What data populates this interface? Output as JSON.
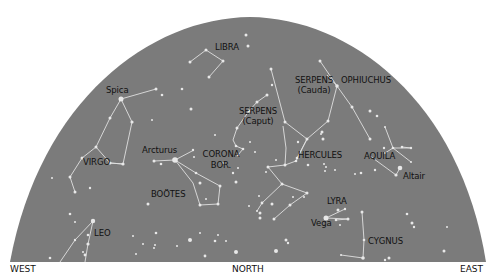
{
  "sky_colors": {
    "dome": "#7b7b7b",
    "star": "#e8e8e8",
    "line": "#e0e0e0",
    "label": "#111111"
  },
  "directions": {
    "west": "WEST",
    "north": "NORTH",
    "east": "EAST"
  },
  "labels": {
    "libra": "LIBRA",
    "spica": "Spica",
    "serpens_cauda_1": "SERPENS",
    "serpens_cauda_2": "(Cauda)",
    "ophiuchus": "OPHIUCHUS",
    "serpens_caput_1": "SERPENS",
    "serpens_caput_2": "(Caput)",
    "arcturus": "Arcturus",
    "corona_1": "CORONA",
    "corona_2": "BOR.",
    "hercules": "HERCULES",
    "aquila": "AQUILA",
    "altair": "Altair",
    "virgo": "VIRGO",
    "bootes": "BOÖTES",
    "lyra": "LYRA",
    "vega": "Vega",
    "leo": "LEO",
    "cygnus": "CYGNUS"
  },
  "stars": [
    [
      121,
      99,
      2.5
    ],
    [
      156,
      89,
      1.5
    ],
    [
      162,
      95,
      1.3
    ],
    [
      110,
      118,
      1.5
    ],
    [
      132,
      122,
      1.6
    ],
    [
      96,
      147,
      1.5
    ],
    [
      82,
      158,
      1.5
    ],
    [
      110,
      163,
      1.5
    ],
    [
      123,
      164,
      1.6
    ],
    [
      70,
      177,
      1.5
    ],
    [
      75,
      192,
      1.5
    ],
    [
      90,
      188,
      1.2
    ],
    [
      52,
      178,
      1
    ],
    [
      190,
      62,
      1.5
    ],
    [
      206,
      50,
      1.5
    ],
    [
      223,
      61,
      1.5
    ],
    [
      209,
      77,
      1.5
    ],
    [
      246,
      35,
      1.5
    ],
    [
      248,
      46,
      1.5
    ],
    [
      182,
      89,
      1.3
    ],
    [
      191,
      109,
      1.5
    ],
    [
      152,
      120,
      1
    ],
    [
      175,
      160,
      2.8
    ],
    [
      154,
      161,
      1.5
    ],
    [
      161,
      164,
      1.3
    ],
    [
      194,
      157,
      1
    ],
    [
      196,
      173,
      1.3
    ],
    [
      200,
      183,
      1.5
    ],
    [
      220,
      186,
      1.5
    ],
    [
      218,
      204,
      1.5
    ],
    [
      200,
      205,
      1.5
    ],
    [
      193,
      150,
      1.2
    ],
    [
      215,
      135,
      1
    ],
    [
      233,
      173,
      1.2
    ],
    [
      236,
      182,
      1.5
    ],
    [
      238,
      168,
      1
    ],
    [
      223,
      163,
      1
    ],
    [
      206,
      199,
      1
    ],
    [
      237,
      128,
      1.5
    ],
    [
      249,
      111,
      1.5
    ],
    [
      257,
      102,
      1.5
    ],
    [
      267,
      95,
      1.5
    ],
    [
      272,
      85,
      1.2
    ],
    [
      236,
      146,
      1.3
    ],
    [
      243,
      149,
      1.3
    ],
    [
      238,
      155,
      1.2
    ],
    [
      255,
      152,
      1
    ],
    [
      250,
      142,
      1
    ],
    [
      271,
      69,
      1.5
    ],
    [
      285,
      122,
      1.5
    ],
    [
      307,
      139,
      1.5
    ],
    [
      298,
      142,
      1.2
    ],
    [
      297,
      158,
      1.3
    ],
    [
      296,
      161,
      1.3
    ],
    [
      285,
      165,
      1.5
    ],
    [
      268,
      167,
      1.5
    ],
    [
      282,
      184,
      1.5
    ],
    [
      259,
      196,
      1
    ],
    [
      262,
      203,
      1.4
    ],
    [
      272,
      204,
      1.5
    ],
    [
      307,
      193,
      1.5
    ],
    [
      290,
      205,
      1.5
    ],
    [
      274,
      219,
      1.5
    ],
    [
      249,
      206,
      1
    ],
    [
      257,
      211,
      1
    ],
    [
      328,
      121,
      1.5
    ],
    [
      322,
      132,
      1.5
    ],
    [
      323,
      139,
      1.5
    ],
    [
      321,
      134,
      1
    ],
    [
      307,
      139,
      1
    ],
    [
      308,
      165,
      1.3
    ],
    [
      276,
      160,
      1
    ],
    [
      266,
      172,
      1
    ],
    [
      320,
      61,
      1.5
    ],
    [
      337,
      86,
      1.8
    ],
    [
      352,
      107,
      1.5
    ],
    [
      370,
      111,
      1.5
    ],
    [
      385,
      127,
      1
    ],
    [
      377,
      116,
      1.3
    ],
    [
      393,
      148,
      1.3
    ],
    [
      385,
      153,
      1
    ],
    [
      402,
      147,
      1.3
    ],
    [
      411,
      148,
      1.2
    ],
    [
      411,
      162,
      1
    ],
    [
      370,
      139,
      1.5
    ],
    [
      384,
      148,
      1.2
    ],
    [
      375,
      170,
      1.2
    ],
    [
      396,
      175,
      1.6
    ],
    [
      400,
      168,
      2.3
    ],
    [
      324,
      164,
      1
    ],
    [
      326,
      167,
      1
    ],
    [
      335,
      170,
      1
    ],
    [
      325,
      171,
      1
    ],
    [
      355,
      174,
      1
    ],
    [
      361,
      173,
      1.3
    ],
    [
      326,
      218,
      2.5
    ],
    [
      338,
      210,
      1.5
    ],
    [
      345,
      209,
      1.2
    ],
    [
      336,
      220,
      1.3
    ],
    [
      348,
      219,
      1.5
    ],
    [
      340,
      225,
      1
    ],
    [
      362,
      212,
      1.5
    ],
    [
      364,
      240,
      1.3
    ],
    [
      363,
      258,
      1.8
    ],
    [
      341,
      255,
      1
    ],
    [
      293,
      197,
      1
    ],
    [
      304,
      197,
      1
    ],
    [
      276,
      251,
      2
    ],
    [
      260,
      218,
      1.5
    ],
    [
      260,
      213,
      1.5
    ],
    [
      286,
      240,
      1.5
    ],
    [
      288,
      243,
      1.2
    ],
    [
      407,
      214,
      1.3
    ],
    [
      414,
      227,
      1.2
    ],
    [
      412,
      223,
      1.5
    ],
    [
      447,
      227,
      1
    ],
    [
      444,
      251,
      1.5
    ],
    [
      389,
      258,
      1.5
    ],
    [
      385,
      260,
      1.2
    ],
    [
      93,
      221,
      2.2
    ],
    [
      88,
      235,
      1.3
    ],
    [
      75,
      240,
      1.2
    ],
    [
      75,
      222,
      1
    ],
    [
      70,
      214,
      1.3
    ],
    [
      88,
      244,
      1.6
    ],
    [
      85,
      255,
      1.4
    ],
    [
      50,
      258,
      1.3
    ],
    [
      83,
      252,
      1
    ],
    [
      156,
      233,
      1.3
    ],
    [
      155,
      245,
      1
    ],
    [
      154,
      248,
      1
    ],
    [
      190,
      240,
      2
    ],
    [
      148,
      204,
      1.5
    ],
    [
      236,
      252,
      2
    ],
    [
      226,
      241,
      1
    ],
    [
      218,
      235,
      1
    ],
    [
      215,
      241,
      1.3
    ],
    [
      200,
      233,
      1
    ],
    [
      205,
      256,
      1.4
    ],
    [
      136,
      254,
      1
    ],
    [
      133,
      236,
      1
    ],
    [
      143,
      244,
      1
    ],
    [
      177,
      246,
      1
    ]
  ],
  "lines": [
    [
      121,
      99,
      156,
      89
    ],
    [
      121,
      99,
      110,
      118
    ],
    [
      121,
      99,
      132,
      122
    ],
    [
      110,
      118,
      96,
      147
    ],
    [
      132,
      122,
      123,
      164
    ],
    [
      96,
      147,
      110,
      163
    ],
    [
      110,
      163,
      123,
      164
    ],
    [
      96,
      147,
      82,
      158
    ],
    [
      82,
      158,
      70,
      177
    ],
    [
      70,
      177,
      75,
      192
    ],
    [
      110,
      163,
      123,
      164
    ],
    [
      190,
      62,
      206,
      50
    ],
    [
      206,
      50,
      223,
      61
    ],
    [
      223,
      61,
      209,
      77
    ],
    [
      175,
      160,
      194,
      150
    ],
    [
      175,
      160,
      154,
      161
    ],
    [
      175,
      160,
      196,
      173
    ],
    [
      175,
      160,
      193,
      183
    ],
    [
      196,
      173,
      220,
      186
    ],
    [
      193,
      183,
      200,
      205
    ],
    [
      200,
      205,
      218,
      204
    ],
    [
      220,
      186,
      218,
      204
    ],
    [
      237,
      128,
      249,
      111
    ],
    [
      249,
      111,
      257,
      102
    ],
    [
      257,
      102,
      267,
      95
    ],
    [
      237,
      128,
      233,
      140
    ],
    [
      233,
      140,
      236,
      146
    ],
    [
      236,
      146,
      243,
      149
    ],
    [
      243,
      149,
      238,
      155
    ],
    [
      271,
      69,
      285,
      122
    ],
    [
      285,
      122,
      307,
      139
    ],
    [
      307,
      139,
      297,
      158
    ],
    [
      296,
      161,
      285,
      165
    ],
    [
      285,
      165,
      268,
      167
    ],
    [
      268,
      167,
      282,
      184
    ],
    [
      282,
      184,
      262,
      203
    ],
    [
      262,
      203,
      257,
      211
    ],
    [
      282,
      184,
      307,
      193
    ],
    [
      307,
      193,
      290,
      205
    ],
    [
      290,
      205,
      274,
      219
    ],
    [
      285,
      165,
      286,
      148
    ],
    [
      286,
      148,
      283,
      126
    ],
    [
      328,
      121,
      307,
      139
    ],
    [
      307,
      139,
      296,
      161
    ],
    [
      327,
      75,
      337,
      86
    ],
    [
      320,
      61,
      337,
      86
    ],
    [
      337,
      86,
      328,
      121
    ],
    [
      337,
      86,
      352,
      107
    ],
    [
      352,
      107,
      370,
      139
    ],
    [
      385,
      127,
      393,
      148
    ],
    [
      393,
      148,
      411,
      148
    ],
    [
      411,
      148,
      402,
      147
    ],
    [
      393,
      148,
      411,
      162
    ],
    [
      393,
      148,
      385,
      153
    ],
    [
      370,
      156,
      396,
      175
    ],
    [
      396,
      175,
      400,
      168
    ],
    [
      326,
      218,
      345,
      209
    ],
    [
      326,
      218,
      348,
      219
    ],
    [
      336,
      220,
      348,
      219
    ],
    [
      362,
      212,
      364,
      240
    ],
    [
      364,
      240,
      363,
      258
    ],
    [
      363,
      258,
      341,
      255
    ],
    [
      93,
      221,
      88,
      244
    ],
    [
      93,
      221,
      75,
      240
    ],
    [
      75,
      240,
      60,
      262
    ],
    [
      88,
      244,
      85,
      262
    ]
  ]
}
